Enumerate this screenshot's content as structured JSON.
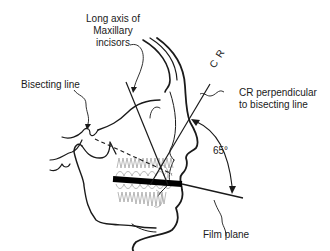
{
  "diagram": {
    "type": "dental-radiography-bisecting-angle-technique",
    "labels": {
      "long_axis_line1": "Long axis of",
      "long_axis_line2": "Maxillary",
      "long_axis_line3": "incisors",
      "bisecting_line": "Bisecting line",
      "cr": "C R",
      "cr_perp_line1": "CR perpendicular",
      "cr_perp_line2": "to bisecting line",
      "angle": "65°",
      "film_plane": "Film plane"
    },
    "colors": {
      "ink": "#1a1a1a",
      "teeth": "#9a9a9a",
      "film": "#000000",
      "background": "#ffffff"
    }
  }
}
